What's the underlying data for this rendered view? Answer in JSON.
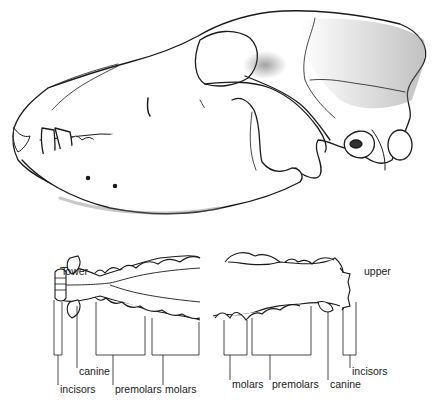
{
  "figure": {
    "skull_view": "lateral",
    "jaws": {
      "lower": {
        "title": "lower",
        "labels": [
          "canine",
          "incisors",
          "premolars",
          "molars"
        ]
      },
      "upper": {
        "title": "upper",
        "labels": [
          "incisors",
          "molars",
          "premolars",
          "canine"
        ]
      }
    }
  },
  "colors": {
    "ink": "#1a1a1a",
    "paper": "#ffffff",
    "stipple": "#6a6a6a"
  }
}
